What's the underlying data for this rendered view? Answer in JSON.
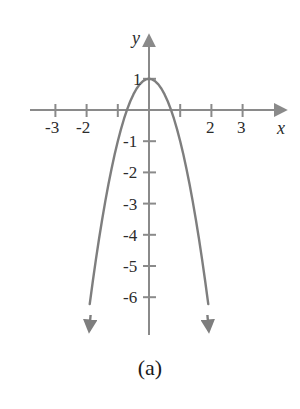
{
  "figure": {
    "caption": "(a)",
    "background_color": "#ffffff",
    "axis_color": "#8a8a8a",
    "curve_color": "#7e7e7e",
    "text_color": "#2b2b2b"
  },
  "axes": {
    "x_axis_name": "x",
    "y_axis_name": "y",
    "x_tick_labels": [
      "-3",
      "-2",
      "2",
      "3"
    ],
    "y_tick_labels": [
      "1",
      "-1",
      "-2",
      "-3",
      "-4",
      "-5",
      "-6"
    ]
  },
  "chart_data": {
    "type": "line",
    "title": "(a)",
    "xlabel": "x",
    "ylabel": "y",
    "xlim": [
      -3.8,
      4.5
    ],
    "ylim": [
      -7.2,
      1.9
    ],
    "grid": false,
    "legend": "none",
    "equation": "y = 1 - 2x^2",
    "vertex": [
      0,
      1
    ],
    "roots": [
      -0.707,
      0.707
    ],
    "x_ticks": [
      -3,
      -2,
      -1,
      1,
      2,
      3
    ],
    "x_tick_labels_shown": {
      "-3": "-3",
      "-2": "-2",
      "2": "2",
      "3": "3"
    },
    "y_ticks": [
      1,
      -1,
      -2,
      -3,
      -4,
      -5,
      -6
    ],
    "y_tick_labels_shown": {
      "1": "1",
      "-1": "-1",
      "-2": "-2",
      "-3": "-3",
      "-4": "-4",
      "-5": "-5",
      "-6": "-6"
    },
    "series": [
      {
        "name": "parabola",
        "x": [
          -1.9,
          -1.8,
          -1.7,
          -1.6,
          -1.5,
          -1.4,
          -1.3,
          -1.2,
          -1.1,
          -1.0,
          -0.9,
          -0.8,
          -0.7,
          -0.6,
          -0.5,
          -0.4,
          -0.3,
          -0.2,
          -0.1,
          0.0,
          0.1,
          0.2,
          0.3,
          0.4,
          0.5,
          0.6,
          0.7,
          0.8,
          0.9,
          1.0,
          1.1,
          1.2,
          1.3,
          1.4,
          1.5,
          1.6,
          1.7,
          1.8,
          1.9
        ],
        "y": [
          -6.22,
          -5.48,
          -4.78,
          -4.12,
          -3.5,
          -2.92,
          -2.38,
          -1.88,
          -1.42,
          -1.0,
          -0.62,
          -0.28,
          0.02,
          0.28,
          0.5,
          0.68,
          0.82,
          0.92,
          0.98,
          1.0,
          0.98,
          0.92,
          0.82,
          0.68,
          0.5,
          0.28,
          0.02,
          -0.28,
          -0.62,
          -1.0,
          -1.42,
          -1.88,
          -2.38,
          -2.92,
          -3.5,
          -4.12,
          -4.78,
          -5.48,
          -6.22
        ]
      }
    ],
    "arrowheads": [
      "x-axis-right",
      "y-axis-top",
      "curve-left-end",
      "curve-right-end"
    ]
  }
}
